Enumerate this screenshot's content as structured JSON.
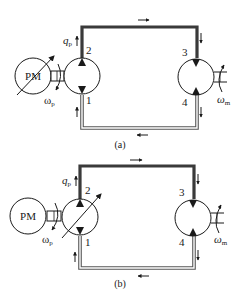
{
  "figure": {
    "colors": {
      "line": "#1a1a1a",
      "pipe_high": "#3a3a3a",
      "pipe_low_fill": "#ffffff",
      "background": "#ffffff"
    }
  },
  "diagram_a": {
    "caption": "(a)",
    "prime_mover": {
      "label": "PM",
      "variable": true
    },
    "pump": {
      "variable": false
    },
    "flow_label": "q",
    "flow_sub": "p",
    "pump_speed_label": "ω",
    "pump_speed_sub": "p",
    "motor_speed_label": "ω",
    "motor_speed_sub": "m",
    "ports": [
      "1",
      "2",
      "3",
      "4"
    ]
  },
  "diagram_b": {
    "caption": "(b)",
    "prime_mover": {
      "label": "PM",
      "variable": false
    },
    "pump": {
      "variable": true
    },
    "flow_label": "q",
    "flow_sub": "p",
    "pump_speed_label": "ω",
    "pump_speed_sub": "p",
    "motor_speed_label": "ω",
    "motor_speed_sub": "m",
    "ports": [
      "1",
      "2",
      "3",
      "4"
    ]
  }
}
